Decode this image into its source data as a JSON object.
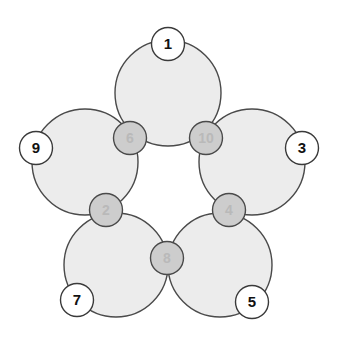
{
  "diagram": {
    "type": "five-circle flower puzzle",
    "colors": {
      "big_circle_fill": "#ececec",
      "outline": "#4a4a4a",
      "outer_node_fill": "#ffffff",
      "outer_label": "#111111",
      "inner_node_fill": "#cdcdcd",
      "inner_label": "#b9b9b9"
    },
    "big_circles": [
      {
        "id": "top",
        "cx": 168,
        "cy": 93,
        "r": 53
      },
      {
        "id": "left",
        "cx": 85,
        "cy": 162,
        "r": 53
      },
      {
        "id": "right",
        "cx": 252,
        "cy": 162,
        "r": 53
      },
      {
        "id": "bottom-left",
        "cx": 116,
        "cy": 265,
        "r": 52
      },
      {
        "id": "bottom-right",
        "cx": 220,
        "cy": 265,
        "r": 52
      }
    ],
    "outer_nodes": [
      {
        "label": "1",
        "cx": 168,
        "cy": 44
      },
      {
        "label": "9",
        "cx": 36,
        "cy": 148
      },
      {
        "label": "3",
        "cx": 302,
        "cy": 148
      },
      {
        "label": "7",
        "cx": 77,
        "cy": 300
      },
      {
        "label": "5",
        "cx": 252,
        "cy": 302
      }
    ],
    "inner_nodes": [
      {
        "label": "6",
        "cx": 130,
        "cy": 138
      },
      {
        "label": "10",
        "cx": 206,
        "cy": 138
      },
      {
        "label": "2",
        "cx": 106,
        "cy": 210
      },
      {
        "label": "4",
        "cx": 229,
        "cy": 210
      },
      {
        "label": "8",
        "cx": 167,
        "cy": 258
      }
    ],
    "node_radius": 16.5
  }
}
